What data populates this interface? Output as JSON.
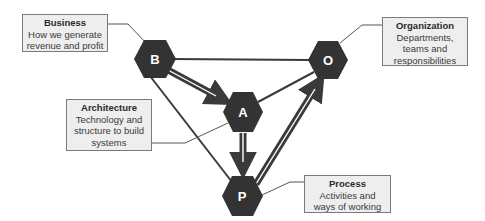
{
  "diagram": {
    "type": "relationship-triangle",
    "colors": {
      "node_fill": "#333333",
      "node_text": "#ffffff",
      "edge": "#3a3a3a",
      "box_fill": "#eeeeee",
      "box_border": "#7a7a7a"
    },
    "nodes": [
      {
        "id": "B",
        "label": "B",
        "name": "Business"
      },
      {
        "id": "O",
        "label": "O",
        "name": "Organization"
      },
      {
        "id": "A",
        "label": "A",
        "name": "Architecture"
      },
      {
        "id": "P",
        "label": "P",
        "name": "Process"
      }
    ],
    "edges": [
      {
        "from": "B",
        "to": "O",
        "style": "line"
      },
      {
        "from": "B",
        "to": "P",
        "style": "line"
      },
      {
        "from": "A",
        "to": "O",
        "style": "line"
      },
      {
        "from": "B",
        "to": "A",
        "style": "double-arrow"
      },
      {
        "from": "A",
        "to": "P",
        "style": "double-arrow"
      },
      {
        "from": "P",
        "to": "O",
        "style": "double-arrow"
      }
    ],
    "labels": {
      "business": {
        "title": "Business",
        "description": "How we generate\nrevenue and profit"
      },
      "organization": {
        "title": "Organization",
        "description": "Departments,\nteams and\nresponsibilities"
      },
      "architecture": {
        "title": "Architecture",
        "description": "Technology and\nstructure to build\nsystems"
      },
      "process": {
        "title": "Process",
        "description": "Activities and\nways of working"
      }
    }
  }
}
